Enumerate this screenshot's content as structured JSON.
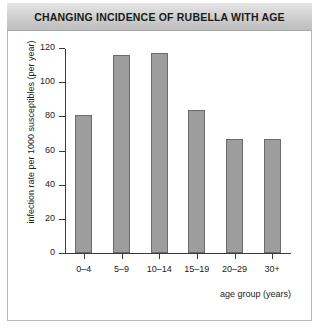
{
  "chart_data": {
    "type": "bar",
    "title": "CHANGING INCIDENCE OF RUBELLA WITH AGE",
    "categories": [
      "0–4",
      "5–9",
      "10–14",
      "15–19",
      "20–29",
      "30+"
    ],
    "values": [
      81,
      116,
      117,
      84,
      67,
      67
    ],
    "xlabel": "age group (years)",
    "ylabel": "infection rate per 1000 susceptibles (per year)",
    "ylim": [
      0,
      120
    ],
    "yticks": [
      0,
      20,
      40,
      60,
      80,
      100,
      120
    ],
    "ytick_labels": [
      "0",
      "20",
      "40",
      "60",
      "80",
      "100",
      "120"
    ],
    "grid": false,
    "legend": false,
    "bar_color": "#9d9d9d",
    "bar_edge_color": "#6b6b6b",
    "title_band_color": "#d2d2d2",
    "axis_color": "#3a3a3a"
  }
}
